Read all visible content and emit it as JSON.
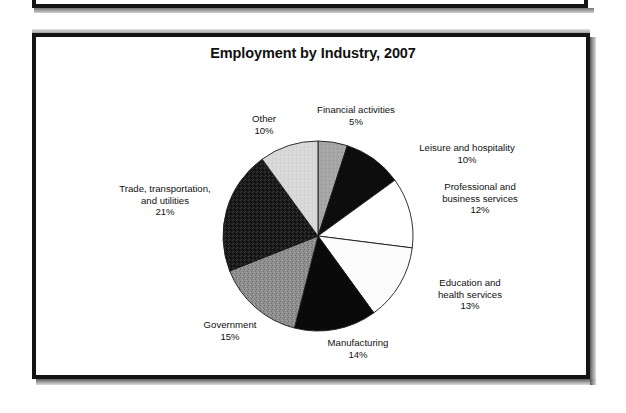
{
  "figure": {
    "title": "Employment by Industry, 2007"
  },
  "chart_data": {
    "type": "pie",
    "title": "Employment by Industry, 2007",
    "xlabel": "",
    "ylabel": "",
    "legend_position": "none",
    "grid": false,
    "units": "percent",
    "start_angle_deg": 0,
    "direction": "clockwise",
    "categories": [
      "Financial activities",
      "Leisure and hospitality",
      "Professional and business services",
      "Education and health services",
      "Manufacturing",
      "Government",
      "Trade, transportation, and utilities",
      "Other"
    ],
    "values": [
      5,
      10,
      12,
      13,
      14,
      15,
      21,
      10
    ],
    "slices": [
      {
        "label": "Financial activities",
        "label_line1": "Financial activities",
        "label_line2": "",
        "value": 5,
        "value_text": "5%",
        "color": "#a5a5a5",
        "texture": "medium-gray",
        "start_deg": 0,
        "end_deg": 18
      },
      {
        "label": "Leisure and hospitality",
        "label_line1": "Leisure and hospitality",
        "label_line2": "",
        "value": 10,
        "value_text": "10%",
        "color": "#0d0d0d",
        "texture": "solid-black",
        "start_deg": 18,
        "end_deg": 54
      },
      {
        "label": "Professional and business services",
        "label_line1": "Professional and",
        "label_line2": "business services",
        "value": 12,
        "value_text": "12%",
        "color": "#ffffff",
        "texture": "white",
        "start_deg": 54,
        "end_deg": 97.2
      },
      {
        "label": "Education and health services",
        "label_line1": "Education and",
        "label_line2": "health services",
        "value": 13,
        "value_text": "13%",
        "color": "#fbfbfb",
        "texture": "white",
        "start_deg": 97.2,
        "end_deg": 144
      },
      {
        "label": "Manufacturing",
        "label_line1": "Manufacturing",
        "label_line2": "",
        "value": 14,
        "value_text": "14%",
        "color": "#0a0a0a",
        "texture": "solid-black",
        "start_deg": 144,
        "end_deg": 194.4
      },
      {
        "label": "Government",
        "label_line1": "Government",
        "label_line2": "",
        "value": 15,
        "value_text": "15%",
        "color": "#8d8d8d",
        "texture": "medium-gray-noise",
        "start_deg": 194.4,
        "end_deg": 248.4
      },
      {
        "label": "Trade, transportation, and utilities",
        "label_line1": "Trade, transportation,",
        "label_line2": "and utilities",
        "value": 21,
        "value_text": "21%",
        "color": "#1e1e1e",
        "texture": "dark-noise",
        "start_deg": 248.4,
        "end_deg": 324
      },
      {
        "label": "Other",
        "label_line1": "Other",
        "label_line2": "",
        "value": 10,
        "value_text": "10%",
        "color": "#d6d6d6",
        "texture": "light-gray",
        "start_deg": 324,
        "end_deg": 360
      }
    ]
  }
}
